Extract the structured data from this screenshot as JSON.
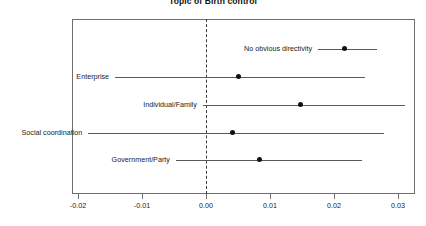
{
  "chart_data": {
    "type": "scatter",
    "title": "Topic of Birth control",
    "subtitle": "",
    "xlabel": "",
    "ylabel": "",
    "xlim": [
      -0.02,
      0.03
    ],
    "grid": false,
    "legend": "none",
    "orientation": "horizontal",
    "reference_line": 0.0,
    "reference_line_style": "dashed",
    "xticks": [
      -0.02,
      -0.01,
      0.0,
      0.01,
      0.02,
      0.03
    ],
    "xtick_labels": [
      "-0.02",
      "-0.01",
      "0.00",
      "0.01",
      "0.02",
      "0.03"
    ],
    "categories": [
      "No obvious directivity",
      "Enterprise",
      "Individual/Family",
      "Social coordination",
      "Government/Party"
    ],
    "values": [
      0.0216,
      0.005,
      0.0147,
      0.0041,
      0.0084
    ],
    "ci_low": [
      0.0175,
      -0.0142,
      -0.0005,
      -0.0184,
      -0.0047
    ],
    "ci_high": [
      0.0267,
      0.0249,
      0.0311,
      0.0278,
      0.0244
    ],
    "points": [
      {
        "label": "No obvious directivity",
        "estimate": 0.0216,
        "ci_low": 0.0175,
        "ci_high": 0.0267
      },
      {
        "label": "Enterprise",
        "estimate": 0.005,
        "ci_low": -0.0142,
        "ci_high": 0.0249
      },
      {
        "label": "Individual/Family",
        "estimate": 0.0147,
        "ci_low": -0.0005,
        "ci_high": 0.0311
      },
      {
        "label": "Social coordination",
        "estimate": 0.0041,
        "ci_low": -0.0184,
        "ci_high": 0.0278
      },
      {
        "label": "Government/Party",
        "estimate": 0.0084,
        "ci_low": -0.0047,
        "ci_high": 0.0244
      }
    ],
    "colors": {
      "point": "#111111",
      "interval": "#5a5a5a",
      "frame": "#6e6e6e",
      "reference_line": "#3b3b3b",
      "background": "#ffffff",
      "text": "#1a1a1a"
    }
  }
}
